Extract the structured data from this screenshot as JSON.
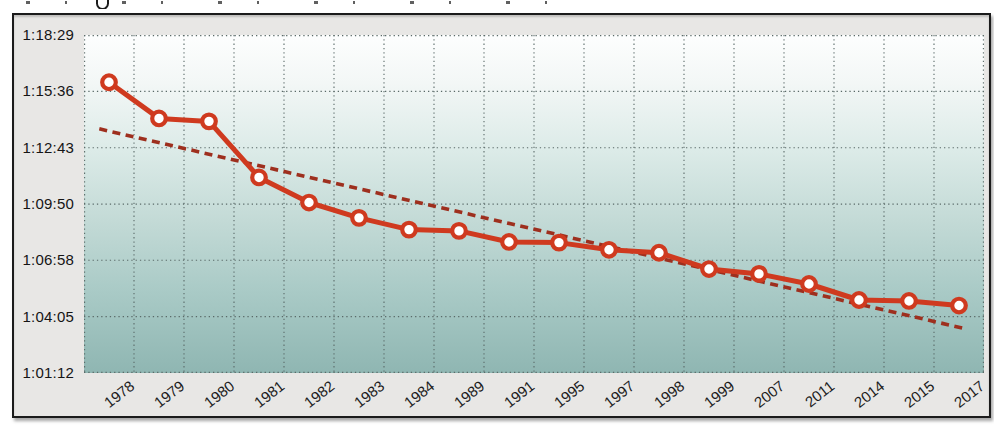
{
  "chart_data": {
    "type": "line",
    "description_visible_elements": "single red line series with open circular markers, dashed linear trend line, dotted grid, time-of-day style y axis, rotated year labels on x axis",
    "categories": [
      "1978",
      "1979",
      "1980",
      "1981",
      "1982",
      "1983",
      "1984",
      "1989",
      "1991",
      "1995",
      "1997",
      "1998",
      "1999",
      "2007",
      "2011",
      "2014",
      "2015",
      "2017"
    ],
    "values_hms": [
      "1:16:04",
      "1:14:13",
      "1:14:04",
      "1:11:12",
      "1:09:55",
      "1:09:08",
      "1:08:32",
      "1:08:28",
      "1:07:54",
      "1:07:52",
      "1:07:30",
      "1:07:21",
      "1:06:31",
      "1:06:16",
      "1:05:45",
      "1:04:56",
      "1:04:53",
      "1:04:39"
    ],
    "values_seconds": [
      4564,
      4453,
      4444,
      4272,
      4195,
      4148,
      4112,
      4108,
      4074,
      4072,
      4050,
      4041,
      3991,
      3976,
      3945,
      3896,
      3893,
      3879
    ],
    "xlabel": "",
    "ylabel": "",
    "y_tick_labels": [
      "1:18:29",
      "1:15:36",
      "1:12:43",
      "1:09:50",
      "1:06:58",
      "1:04:05",
      "1:01:12"
    ],
    "y_tick_seconds": [
      4709,
      4536,
      4363,
      4190,
      4018,
      3845,
      3672
    ],
    "ylim_seconds": [
      3672,
      4709
    ],
    "grid": "dotted-both-axes",
    "legend": "none",
    "series": [
      {
        "name": "times",
        "type": "line-with-markers",
        "color": "#cf3a1f",
        "marker": "circle-white-fill"
      }
    ],
    "trendline": {
      "type": "linear",
      "style": "dashed",
      "color": "#9e2f1e",
      "start_frac_x": 0.017,
      "start_seconds": 4421,
      "end_frac_x": 0.976,
      "end_seconds": 3810
    },
    "colors": {
      "series_line": "#cf3a1f",
      "marker_fill": "#ffffff",
      "trend_dash": "#9e2f1e",
      "grid_dots": "#5a6a68",
      "plot_gradient_top": "#fdfefe",
      "plot_gradient_bottom": "#8fb6b2",
      "frame_background": "#e8e7e5",
      "frame_border": "#1b1b1b",
      "tick_text": "#1a1a1a"
    }
  }
}
